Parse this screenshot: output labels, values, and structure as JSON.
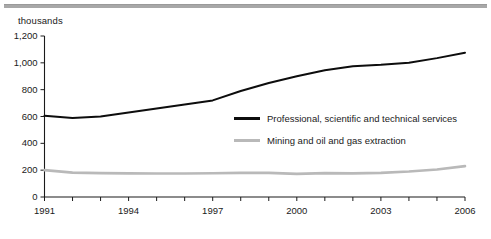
{
  "chart_data": {
    "type": "line",
    "title": "",
    "subtitle": "",
    "unit_label": "thousands",
    "xlabel": "",
    "ylabel": "",
    "x": [
      1991,
      1992,
      1993,
      1994,
      1995,
      1996,
      1997,
      1998,
      1999,
      2000,
      2001,
      2002,
      2003,
      2004,
      2005,
      2006
    ],
    "xlim": [
      1991,
      2006
    ],
    "ylim": [
      0,
      1200
    ],
    "ytick_values": [
      0,
      200,
      400,
      600,
      800,
      1000,
      1200
    ],
    "ytick_labels": [
      "0",
      "200",
      "400",
      "600",
      "800",
      "1,000",
      "1,200"
    ],
    "xtick_values": [
      1991,
      1992,
      1993,
      1994,
      1995,
      1996,
      1997,
      1998,
      1999,
      2000,
      2001,
      2002,
      2003,
      2004,
      2005,
      2006
    ],
    "xtick_labels": [
      "1991",
      "",
      "",
      "1994",
      "",
      "",
      "1997",
      "",
      "",
      "2000",
      "",
      "",
      "2003",
      "",
      "",
      "2006"
    ],
    "grid": false,
    "legend_position": "inside-right",
    "series": [
      {
        "name": "Professional, scientific and technical services",
        "color": "#0d0d0d",
        "values": [
          605,
          588,
          600,
          630,
          660,
          690,
          720,
          790,
          850,
          900,
          945,
          975,
          985,
          1000,
          1035,
          1075
        ]
      },
      {
        "name": "Mining and oil and gas extraction",
        "color": "#b9b9b9",
        "values": [
          200,
          182,
          178,
          176,
          175,
          175,
          177,
          180,
          180,
          172,
          178,
          176,
          180,
          190,
          205,
          230
        ]
      }
    ],
    "annotations": []
  },
  "footer": {
    "source": ""
  }
}
